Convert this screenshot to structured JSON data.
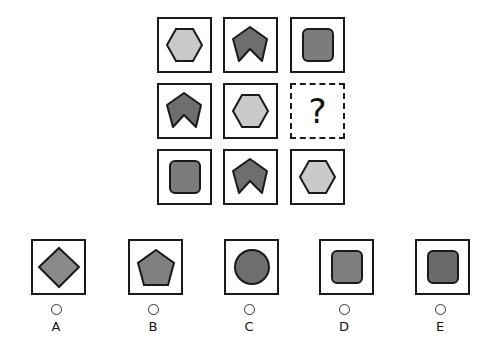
{
  "puzzle": {
    "grid": [
      [
        {
          "shape": "hexagon",
          "fill": "#c9c9c9"
        },
        {
          "shape": "arrow",
          "fill": "#6e6e6e"
        },
        {
          "shape": "rounded-square",
          "fill": "#7c7c7c"
        }
      ],
      [
        {
          "shape": "arrow",
          "fill": "#6e6e6e"
        },
        {
          "shape": "hexagon",
          "fill": "#c9c9c9"
        },
        {
          "shape": "missing",
          "symbol": "?"
        }
      ],
      [
        {
          "shape": "rounded-square",
          "fill": "#7c7c7c"
        },
        {
          "shape": "arrow",
          "fill": "#6e6e6e"
        },
        {
          "shape": "hexagon",
          "fill": "#c9c9c9"
        }
      ]
    ],
    "missing_symbol": "?"
  },
  "options": [
    {
      "label": "A",
      "shape": "diamond",
      "fill": "#8a8a8a"
    },
    {
      "label": "B",
      "shape": "pentagon",
      "fill": "#808080"
    },
    {
      "label": "C",
      "shape": "circle",
      "fill": "#6e6e6e"
    },
    {
      "label": "D",
      "shape": "rounded-square",
      "fill": "#7e7e7e"
    },
    {
      "label": "E",
      "shape": "rounded-square",
      "fill": "#6a6a6a"
    }
  ]
}
